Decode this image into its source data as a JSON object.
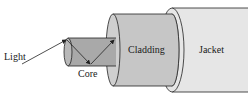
{
  "diagram": {
    "labels": {
      "light": "Light",
      "core": "Core",
      "cladding": "Cladding",
      "jacket": "Jacket"
    },
    "colors": {
      "jacket": "#e6e6e6",
      "cladding": "#c6c6c6",
      "core": "#a9a9a9",
      "outline": "#222222"
    }
  }
}
